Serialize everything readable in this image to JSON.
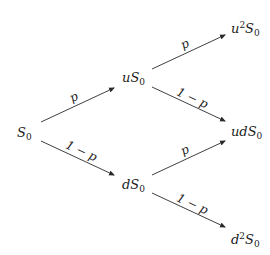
{
  "diagram": {
    "type": "binomial-tree",
    "nodes": {
      "root": {
        "base": "S",
        "sub": "0",
        "prefix": ""
      },
      "up": {
        "prefix": "u",
        "base": "S",
        "sub": "0"
      },
      "down": {
        "prefix": "d",
        "base": "S",
        "sub": "0"
      },
      "upup": {
        "prefix": "u",
        "sup": "2",
        "base": "S",
        "sub": "0"
      },
      "updown": {
        "prefix": "ud",
        "base": "S",
        "sub": "0"
      },
      "downdown": {
        "prefix": "d",
        "sup": "2",
        "base": "S",
        "sub": "0"
      }
    },
    "edges": [
      {
        "from": "S0",
        "to": "uS0",
        "label": "p"
      },
      {
        "from": "S0",
        "to": "dS0",
        "label": "1 − p"
      },
      {
        "from": "uS0",
        "to": "u²S0",
        "label": "p"
      },
      {
        "from": "uS0",
        "to": "udS0",
        "label": "1 − p"
      },
      {
        "from": "dS0",
        "to": "udS0",
        "label": "p"
      },
      {
        "from": "dS0",
        "to": "d²S0",
        "label": "1 − p"
      }
    ],
    "colors": {
      "line": "#2a2a2a",
      "text": "#1a1a1a",
      "background": "#ffffff"
    }
  }
}
